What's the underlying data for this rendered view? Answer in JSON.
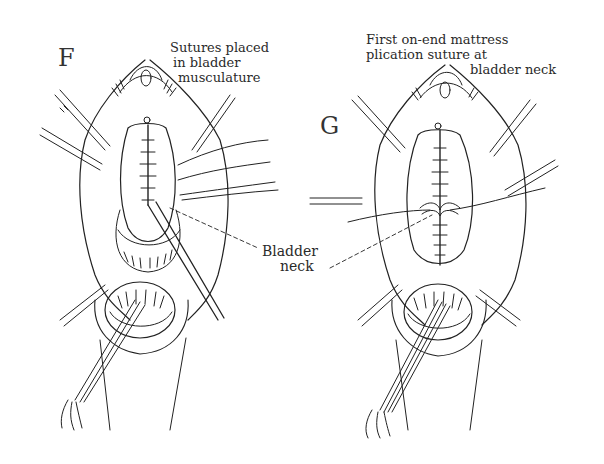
{
  "figure": {
    "panels": [
      {
        "letter": "F",
        "caption_lines": [
          "Sutures placed",
          "in bladder",
          "musculature"
        ]
      },
      {
        "letter": "G",
        "caption_lines": [
          "First on-end mattress",
          "plication suture at",
          "bladder neck"
        ]
      }
    ],
    "shared_label": {
      "lines": [
        "Bladder",
        "neck"
      ]
    }
  },
  "colors": {
    "ink": "#222222",
    "background": "#ffffff"
  }
}
